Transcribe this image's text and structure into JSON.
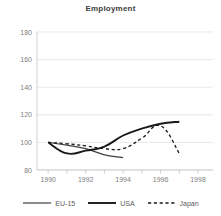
{
  "chart_data": {
    "type": "line",
    "title": "Employment",
    "xlabel": "",
    "ylabel": "",
    "xlim": [
      1989.4,
      1998.8
    ],
    "ylim": [
      80,
      180
    ],
    "grid": true,
    "legend_position": "bottom",
    "xticks": [
      "1990",
      "1992",
      "1994",
      "1996",
      "1998"
    ],
    "xtick_values": [
      1990,
      1992,
      1994,
      1996,
      1998
    ],
    "yticks": [
      "80",
      "100",
      "120",
      "140",
      "160",
      "180"
    ],
    "ytick_values": [
      80,
      100,
      120,
      140,
      160,
      180
    ],
    "series": [
      {
        "name": "EU-15",
        "style": "thin-solid",
        "color": "#404040",
        "x": [
          1990,
          1991,
          1992,
          1993,
          1994
        ],
        "values": [
          100,
          98,
          95.5,
          91,
          89
        ]
      },
      {
        "name": "USA",
        "style": "thick-solid",
        "color": "#1a1a1a",
        "x": [
          1990,
          1991,
          1992,
          1993,
          1994,
          1995,
          1996,
          1997
        ],
        "values": [
          100,
          92,
          94,
          97,
          105,
          110,
          113.5,
          115
        ]
      },
      {
        "name": "Japan",
        "style": "dashed",
        "color": "#1a1a1a",
        "x": [
          1990,
          1991,
          1992,
          1993,
          1994,
          1995,
          1996,
          1997
        ],
        "values": [
          100,
          99,
          97.5,
          95.5,
          95.5,
          103,
          112,
          92
        ]
      }
    ]
  },
  "legend": {
    "items": [
      {
        "label": "EU-15"
      },
      {
        "label": "USA"
      },
      {
        "label": "Japan"
      }
    ]
  },
  "colors": {
    "grid": "#d9d9d9",
    "axis": "#bfbfbf",
    "text": "#808080",
    "title": "#404040"
  }
}
